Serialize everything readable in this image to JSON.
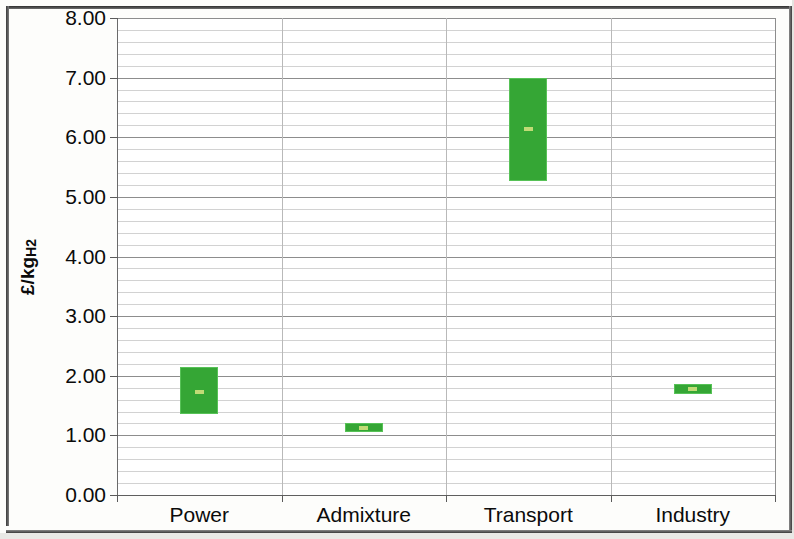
{
  "chart_data": {
    "type": "bar",
    "subtype": "floating-range-bar",
    "title": "",
    "xlabel": "",
    "ylabel": "£/kgH2",
    "ylabel_plain": "£/kgH2",
    "ylim": [
      0.0,
      8.0
    ],
    "ytick_step": 1.0,
    "minor_gridline_step": 0.2,
    "grid": true,
    "legend": false,
    "categories": [
      "Power",
      "Admixture",
      "Transport",
      "Industry"
    ],
    "ytick_labels": [
      "8.00",
      "7.00",
      "6.00",
      "5.00",
      "4.00",
      "3.00",
      "2.00",
      "1.00",
      "0.00"
    ],
    "ytick_values": [
      8.0,
      7.0,
      6.0,
      5.0,
      4.0,
      3.0,
      2.0,
      1.0,
      0.0
    ],
    "series": [
      {
        "name": "Range low",
        "values": [
          1.37,
          1.05,
          5.27,
          1.7
        ]
      },
      {
        "name": "Range high",
        "values": [
          2.15,
          1.2,
          7.0,
          1.87
        ]
      },
      {
        "name": "Midpoint",
        "values": [
          1.73,
          1.13,
          6.13,
          1.78
        ]
      }
    ],
    "bars": [
      {
        "category": "Power",
        "low": 1.37,
        "high": 2.15,
        "mid": 1.73
      },
      {
        "category": "Admixture",
        "low": 1.05,
        "high": 1.2,
        "mid": 1.13
      },
      {
        "category": "Transport",
        "low": 5.27,
        "high": 7.0,
        "mid": 6.13
      },
      {
        "category": "Industry",
        "low": 1.7,
        "high": 1.87,
        "mid": 1.78
      }
    ],
    "colors": {
      "bar_fill": "#35a635",
      "bar_edge": "#57c257",
      "midpoint_marker": "#c9dd7a",
      "major_gridline": "#8d8d8d",
      "minor_gridline": "#d2d2d2",
      "axis": "#5f5f5f",
      "plot_background": "#ffffff",
      "page_background": "#fdfdfb",
      "frame": "#2e2e2e",
      "text": "#0b0b0b"
    }
  }
}
